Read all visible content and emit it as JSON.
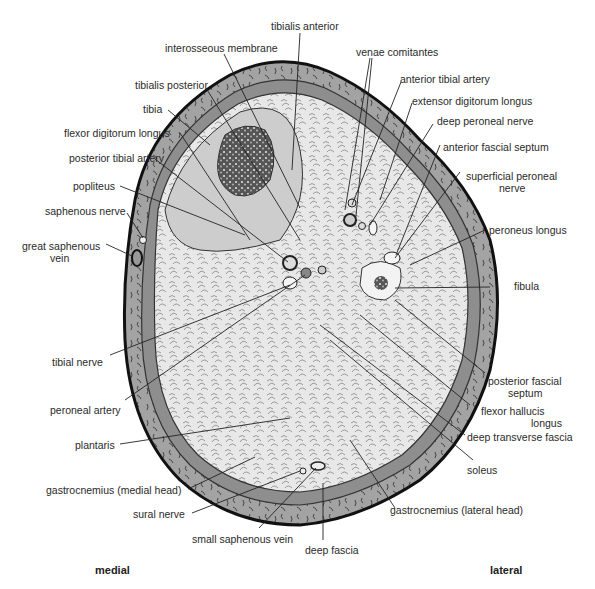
{
  "figure": {
    "orientation": {
      "left": "medial",
      "right": "lateral"
    },
    "colors": {
      "outline": "#111111",
      "subcutaneous": "#9a9a9a",
      "deep_compartment": "#cfcfcf",
      "muscle": "#e6e6e6",
      "bone_marrow": "#333333",
      "background": "#ffffff"
    },
    "labels": {
      "tibialis_anterior": "tibialis anterior",
      "interosseous_membrane": "interosseous membrane",
      "venae_comitantes": "venae comitantes",
      "anterior_tibial_artery": "anterior tibial artery",
      "tibialis_posterior": "tibialis posterior",
      "extensor_digitorum_longus": "extensor digitorum longus",
      "tibia": "tibia",
      "deep_peroneal_nerve": "deep peroneal nerve",
      "flexor_digitorum_longus": "flexor digitorum longus",
      "anterior_fascial_septum": "anterior fascial septum",
      "posterior_tibial_artery": "posterior tibial artery",
      "superficial_peroneal_nerve_1": "superficial peroneal",
      "superficial_peroneal_nerve_2": "nerve",
      "popliteus": "popliteus",
      "saphenous_nerve": "saphenous nerve",
      "great_saphenous_vein_1": "great saphenous",
      "great_saphenous_vein_2": "vein",
      "peroneus_longus": "peroneus longus",
      "fibula": "fibula",
      "tibial_nerve": "tibial nerve",
      "posterior_fascial_septum_1": "posterior fascial",
      "posterior_fascial_septum_2": "septum",
      "peroneal_artery": "peroneal artery",
      "flexor_hallucis_longus_1": "flexor hallucis",
      "flexor_hallucis_longus_2": "longus",
      "deep_transverse_fascia": "deep transverse fascia",
      "plantaris": "plantaris",
      "soleus": "soleus",
      "gastrocnemius_medial": "gastrocnemius (medial head)",
      "gastrocnemius_lateral": "gastrocnemius (lateral head)",
      "sural_nerve": "sural nerve",
      "small_saphenous_vein": "small saphenous vein",
      "deep_fascia": "deep fascia"
    }
  }
}
